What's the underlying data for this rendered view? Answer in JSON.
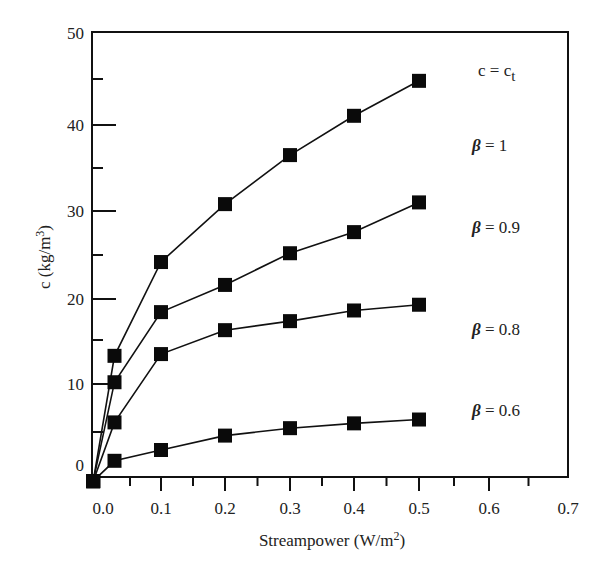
{
  "chart_data": {
    "type": "line",
    "title": "",
    "xlabel": "Streampower (W/m²)",
    "ylabel": "c (kg/m³)",
    "xlim": [
      0.0,
      0.7
    ],
    "ylim": [
      0,
      50
    ],
    "x_ticks": [
      "0.0",
      "0.1",
      "0.2",
      "0.3",
      "0.4",
      "0.5",
      "0.6",
      "0.7"
    ],
    "y_ticks": [
      "0",
      "10",
      "20",
      "30",
      "40",
      "50"
    ],
    "grid": false,
    "legend": "inline labels at right",
    "marker": "filled square",
    "series": [
      {
        "name": "c = c_t",
        "x": [
          -0.01,
          0.025,
          0.1,
          0.2,
          0.3,
          0.4,
          0.5
        ],
        "values": [
          -1,
          13.2,
          24.2,
          30.8,
          36.5,
          41.0,
          44.8
        ]
      },
      {
        "name": "β = 0.9",
        "x": [
          -0.01,
          0.025,
          0.1,
          0.2,
          0.3,
          0.4,
          0.5
        ],
        "values": [
          -1,
          10.2,
          18.4,
          21.6,
          25.2,
          27.6,
          31.0
        ]
      },
      {
        "name": "β = 0.8",
        "x": [
          -0.01,
          0.025,
          0.1,
          0.2,
          0.3,
          0.4,
          0.5
        ],
        "values": [
          -1,
          6.0,
          13.4,
          16.2,
          17.3,
          18.6,
          19.3
        ]
      },
      {
        "name": "β = 0.6",
        "x": [
          -0.01,
          0.025,
          0.1,
          0.2,
          0.3,
          0.4,
          0.5
        ],
        "values": [
          -1,
          1.8,
          3.0,
          4.6,
          5.4,
          5.9,
          6.3
        ]
      }
    ],
    "annotations": [
      {
        "text_main": "c = c",
        "text_sub": "t",
        "kind": "ct"
      },
      {
        "text_beta": "β",
        "text_rest": " = 1",
        "kind": "beta"
      },
      {
        "text_beta": "β",
        "text_rest": " = 0.9",
        "kind": "beta"
      },
      {
        "text_beta": "β",
        "text_rest": " = 0.8",
        "kind": "beta"
      },
      {
        "text_beta": "β",
        "text_rest": " = 0.6",
        "kind": "beta"
      }
    ]
  },
  "axes": {
    "x_title_main": "Streampower (W/m",
    "x_title_sup": "2",
    "x_title_end": ")",
    "y_title_main": "c (kg/m",
    "y_title_sup": "3",
    "y_title_end": ")"
  }
}
